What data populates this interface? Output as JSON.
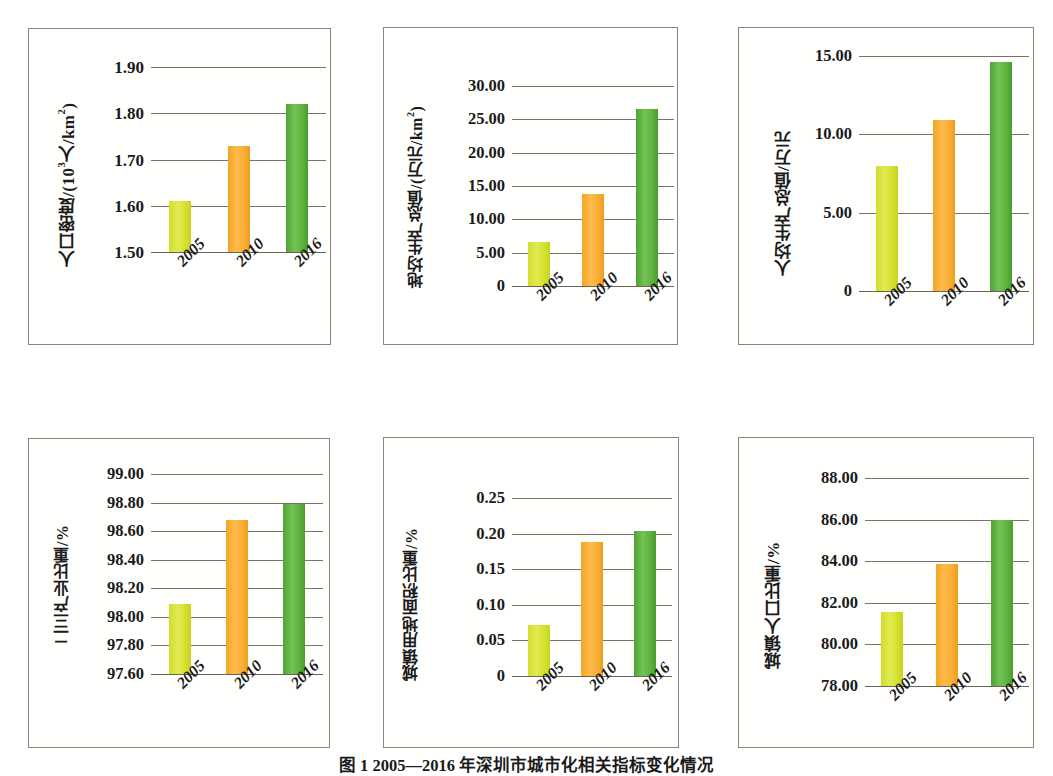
{
  "figure": {
    "caption": "图 1 2005—2016 年深圳市城市化相关指标变化情况",
    "background": "#ffffff",
    "frame_color": "#8a8577",
    "gridline_color": "#7d7263"
  },
  "series_colors": {
    "2005": "#d4e02d",
    "2010": "#f9ad32",
    "2016": "#5cb23c"
  },
  "charts": [
    {
      "id": "population-density",
      "ylabel_parts": {
        "pre": "人口密度/(10",
        "sup": "3",
        "post": "人/km",
        "sup2": "2",
        "post2": ")"
      },
      "ylabel": "人口密度/(10³人/km²)",
      "chart_data": {
        "type": "bar",
        "title": "",
        "xlabel": "",
        "ylabel": "人口密度/(10³人/km²)",
        "categories": [
          "2005",
          "2010",
          "2016"
        ],
        "values": [
          1.61,
          1.73,
          1.82
        ],
        "ylim": [
          1.5,
          1.9
        ],
        "yticks": [
          1.5,
          1.6,
          1.7,
          1.8,
          1.9
        ],
        "ytick_labels": [
          "1.50",
          "1.60",
          "1.70",
          "1.80",
          "1.90"
        ],
        "grid": true,
        "legend": "none"
      }
    },
    {
      "id": "gdp-per-land",
      "ylabel": "地均生产总值/(万元/km²)",
      "chart_data": {
        "type": "bar",
        "title": "",
        "xlabel": "",
        "ylabel": "地均生产总值/(万元/km²)",
        "categories": [
          "2005",
          "2010",
          "2016"
        ],
        "values": [
          6.6,
          13.8,
          26.5
        ],
        "ylim": [
          0,
          30
        ],
        "yticks": [
          0,
          5,
          10,
          15,
          20,
          25,
          30
        ],
        "ytick_labels": [
          "0",
          "5.00",
          "10.00",
          "15.00",
          "20.00",
          "25.00",
          "30.00"
        ],
        "grid": true,
        "legend": "none"
      }
    },
    {
      "id": "gdp-per-capita",
      "ylabel": "人均生产总值/万元",
      "chart_data": {
        "type": "bar",
        "title": "",
        "xlabel": "",
        "ylabel": "人均生产总值/万元",
        "categories": [
          "2005",
          "2010",
          "2016"
        ],
        "values": [
          7.95,
          10.9,
          14.6
        ],
        "ylim": [
          0,
          15
        ],
        "yticks": [
          0,
          5,
          10,
          15
        ],
        "ytick_labels": [
          "0",
          "5.00",
          "10.00",
          "15.00"
        ],
        "grid": true,
        "legend": "none"
      }
    },
    {
      "id": "secondary-tertiary-industry-share",
      "ylabel": "二三产业比重/%",
      "chart_data": {
        "type": "bar",
        "title": "",
        "xlabel": "",
        "ylabel": "二三产业比重/%",
        "categories": [
          "2005",
          "2010",
          "2016"
        ],
        "values": [
          98.09,
          98.68,
          98.79
        ],
        "ylim": [
          97.6,
          99.0
        ],
        "yticks": [
          97.6,
          97.8,
          98.0,
          98.2,
          98.4,
          98.6,
          98.8,
          99.0
        ],
        "ytick_labels": [
          "97.60",
          "97.80",
          "98.00",
          "98.20",
          "98.40",
          "98.60",
          "98.80",
          "99.00"
        ],
        "grid": true,
        "legend": "none"
      }
    },
    {
      "id": "urban-land-area-share",
      "ylabel": "城镇用地面积比重/%",
      "chart_data": {
        "type": "bar",
        "title": "",
        "xlabel": "",
        "ylabel": "城镇用地面积比重/%",
        "categories": [
          "2005",
          "2010",
          "2016"
        ],
        "values": [
          0.071,
          0.188,
          0.204
        ],
        "ylim": [
          0,
          0.25
        ],
        "yticks": [
          0,
          0.05,
          0.1,
          0.15,
          0.2,
          0.25
        ],
        "ytick_labels": [
          "0",
          "0.05",
          "0.10",
          "0.15",
          "0.20",
          "0.25"
        ],
        "grid": true,
        "legend": "none"
      }
    },
    {
      "id": "urban-population-share",
      "ylabel": "城镇人口比重/%",
      "chart_data": {
        "type": "bar",
        "title": "",
        "xlabel": "",
        "ylabel": "城镇人口比重/%",
        "categories": [
          "2005",
          "2010",
          "2016"
        ],
        "values": [
          81.55,
          83.85,
          86.0
        ],
        "ylim": [
          78.0,
          88.0
        ],
        "yticks": [
          78,
          80,
          82,
          84,
          86,
          88
        ],
        "ytick_labels": [
          "78.00",
          "80.00",
          "82.00",
          "84.00",
          "86.00",
          "88.00"
        ],
        "grid": true,
        "legend": "none"
      }
    }
  ]
}
